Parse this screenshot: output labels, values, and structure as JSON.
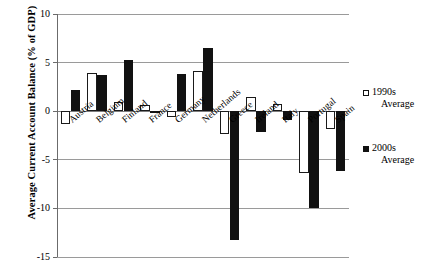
{
  "chart_data": {
    "type": "bar",
    "title": "",
    "xlabel": "",
    "ylabel": "Average Current Account Balance (% of GDP)",
    "ylim": [
      -15,
      10
    ],
    "yticks": [
      10,
      5,
      0,
      -5,
      -10,
      -15
    ],
    "ytick_labels": [
      "10",
      "5",
      "0",
      "-5",
      "-10",
      "-15"
    ],
    "grid": true,
    "legend_position": "right",
    "categories": [
      "Austria",
      "Belgium",
      "Finland",
      "France",
      "Germany",
      "Netherlands",
      "Greece",
      "Ireland",
      "Italy",
      "Portugal",
      "Spain"
    ],
    "series": [
      {
        "name": "1990s Average",
        "color": "#ffffff",
        "edge_color": "#111111",
        "values": [
          -1.3,
          3.9,
          0.9,
          0.6,
          -0.6,
          4.1,
          -2.3,
          1.5,
          0.7,
          -6.4,
          -1.8
        ]
      },
      {
        "name": "2000s Average",
        "color": "#111111",
        "edge_color": "#111111",
        "values": [
          2.2,
          3.7,
          5.3,
          -0.15,
          3.8,
          6.5,
          -13.3,
          -2.1,
          -0.9,
          -10.0,
          -6.2
        ]
      }
    ]
  },
  "legend": {
    "entries": [
      {
        "label_line1": "1990s",
        "label_line2": "Average",
        "swatch": "white-square-icon"
      },
      {
        "label_line1": "2000s",
        "label_line2": "Average",
        "swatch": "black-square-icon"
      }
    ]
  },
  "axis": {
    "y_title": "Average Current Account Balance (% of GDP)"
  }
}
